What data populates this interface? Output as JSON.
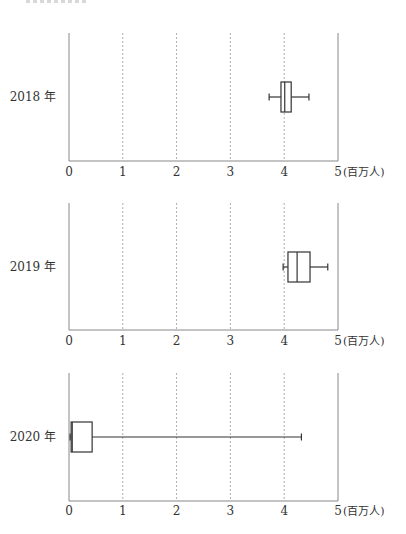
{
  "chart_data": {
    "type": "boxplot",
    "title": "",
    "xlabel": "(百万人)",
    "ylabel": "",
    "xlim": [
      0,
      5
    ],
    "x_ticks": [
      "0",
      "1",
      "2",
      "3",
      "4",
      "5"
    ],
    "unit": "(百万人)",
    "grid": "vertical dashed at 1,2,3,4",
    "orientation": "horizontal",
    "series": [
      {
        "name": "2018 年",
        "min": 3.72,
        "q1": 3.94,
        "median": 4.01,
        "q3": 4.13,
        "max": 4.46
      },
      {
        "name": "2019 年",
        "min": 3.98,
        "q1": 4.07,
        "median": 4.24,
        "q3": 4.48,
        "max": 4.81
      },
      {
        "name": "2020 年",
        "min": 0.02,
        "q1": 0.04,
        "median": 0.06,
        "q3": 0.43,
        "max": 4.32
      }
    ]
  },
  "panels": [
    {
      "year_label": "2018 年"
    },
    {
      "year_label": "2019 年"
    },
    {
      "year_label": "2020 年"
    }
  ],
  "axis": {
    "ticks": [
      "0",
      "1",
      "2",
      "3",
      "4",
      "5"
    ],
    "unit": "(百万人)"
  }
}
